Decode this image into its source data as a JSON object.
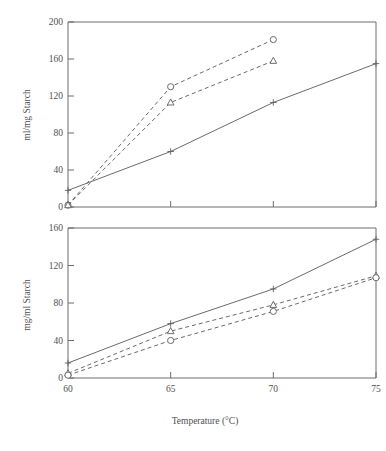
{
  "figure": {
    "x_axis_title": "Temperature (°C)",
    "x_ticks": [
      "60",
      "65",
      "70",
      "75"
    ],
    "panels": [
      {
        "id": "top",
        "y_axis_title": "ml/mg Starch",
        "y_ticks": [
          "0",
          "40",
          "80",
          "120",
          "160",
          "200"
        ]
      },
      {
        "id": "bottom",
        "y_axis_title": "mg/ml Starch",
        "y_ticks": [
          "0",
          "40",
          "80",
          "120",
          "160"
        ]
      }
    ]
  },
  "chart_data": [
    {
      "type": "line",
      "panel": "top",
      "title": "",
      "xlabel": "Temperature (°C)",
      "ylabel": "ml/mg Starch",
      "x": [
        60,
        65,
        70,
        75
      ],
      "xlim": [
        60,
        75
      ],
      "ylim": [
        0,
        200
      ],
      "xticks": [
        60,
        65,
        70,
        75
      ],
      "yticks": [
        0,
        40,
        80,
        120,
        160,
        200
      ],
      "grid": false,
      "legend": "none",
      "series": [
        {
          "name": "circle-dashed",
          "marker": "circle",
          "linestyle": "dashed",
          "x": [
            60,
            65,
            70
          ],
          "values": [
            2,
            130,
            181
          ]
        },
        {
          "name": "triangle-dashed",
          "marker": "triangle",
          "linestyle": "dashed",
          "x": [
            60,
            65,
            70
          ],
          "values": [
            2,
            113,
            158
          ]
        },
        {
          "name": "plus-solid",
          "marker": "plus",
          "linestyle": "solid",
          "x": [
            60,
            65,
            70,
            75
          ],
          "values": [
            18,
            60,
            113,
            155
          ]
        }
      ]
    },
    {
      "type": "line",
      "panel": "bottom",
      "title": "",
      "xlabel": "Temperature (°C)",
      "ylabel": "mg/ml Starch",
      "x": [
        60,
        65,
        70,
        75
      ],
      "xlim": [
        60,
        75
      ],
      "ylim": [
        0,
        160
      ],
      "xticks": [
        60,
        65,
        70,
        75
      ],
      "yticks": [
        0,
        40,
        80,
        120,
        160
      ],
      "grid": false,
      "legend": "none",
      "series": [
        {
          "name": "plus-solid",
          "marker": "plus",
          "linestyle": "solid",
          "x": [
            60,
            65,
            70,
            75
          ],
          "values": [
            16,
            58,
            95,
            148
          ]
        },
        {
          "name": "triangle-dashed",
          "marker": "triangle",
          "linestyle": "dashed",
          "x": [
            60,
            65,
            70,
            75
          ],
          "values": [
            5,
            50,
            78,
            109
          ]
        },
        {
          "name": "circle-dashed",
          "marker": "circle",
          "linestyle": "dashed",
          "x": [
            60,
            65,
            70,
            75
          ],
          "values": [
            3,
            40,
            71,
            107
          ]
        }
      ]
    }
  ]
}
